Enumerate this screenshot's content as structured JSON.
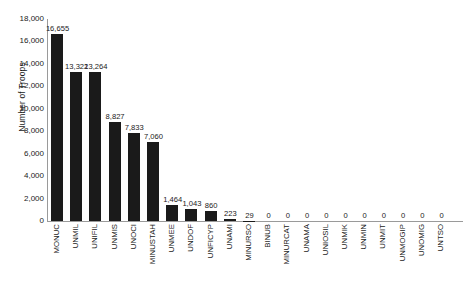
{
  "chart_data": {
    "type": "bar",
    "title": "",
    "xlabel": "",
    "ylabel": "Number of Troops",
    "ylim": [
      0,
      18000
    ],
    "ytick_step": 2000,
    "ytick_labels": [
      "18,000",
      "16,000",
      "14,000",
      "12,000",
      "10,000",
      "8,000",
      "6,000",
      "4,000",
      "2,000",
      "0"
    ],
    "ytick_values": [
      18000,
      16000,
      14000,
      12000,
      10000,
      8000,
      6000,
      4000,
      2000,
      0
    ],
    "grid": false,
    "legend": null,
    "bar_color": "#1a1a1a",
    "axis_color": "#9a9a9a",
    "categories": [
      "MONUC",
      "UNMIL",
      "UNIFIL",
      "UNMIS",
      "UNOCI",
      "MINUSTAH",
      "UNMEE",
      "UNDOF",
      "UNFICYP",
      "UNAMI",
      "MINURSO",
      "BINUB",
      "MINURCAT",
      "UNAMA",
      "UNIOSIL",
      "UNMIK",
      "UNMIN",
      "UNMIT",
      "UNMOGIP",
      "UNOMIG",
      "UNTSO"
    ],
    "values": [
      16655,
      13322,
      13264,
      8827,
      7833,
      7060,
      1464,
      1043,
      860,
      223,
      29,
      0,
      0,
      0,
      0,
      0,
      0,
      0,
      0,
      0,
      0
    ],
    "value_labels": [
      "16,655",
      "13,322",
      "13,264",
      "8,827",
      "7,833",
      "7,060",
      "1,464",
      "1,043",
      "860",
      "223",
      "29",
      "0",
      "0",
      "0",
      "0",
      "0",
      "0",
      "0",
      "0",
      "0",
      "0"
    ]
  }
}
